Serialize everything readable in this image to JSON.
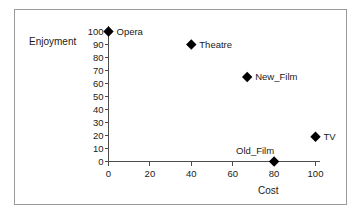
{
  "chart_data": {
    "type": "scatter",
    "title": "",
    "xlabel": "Cost",
    "ylabel": "Enjoyment",
    "xlim": [
      0,
      100
    ],
    "ylim": [
      0,
      100
    ],
    "xticks": [
      0,
      20,
      40,
      60,
      80,
      100
    ],
    "yticks": [
      0,
      10,
      20,
      30,
      40,
      50,
      60,
      70,
      80,
      90,
      100
    ],
    "xtick_labels": [
      "0",
      "20",
      "40",
      "60",
      "80",
      "100"
    ],
    "ytick_labels": [
      "0",
      "10",
      "20",
      "30",
      "40",
      "50",
      "60",
      "70",
      "80",
      "90",
      "100"
    ],
    "grid": false,
    "legend": "none",
    "marker": "diamond",
    "marker_color": "#000000",
    "axis_color": "#4d4d4d",
    "points": [
      {
        "label": "Opera",
        "x": 0,
        "y": 100,
        "label_position": "right"
      },
      {
        "label": "Theatre",
        "x": 40,
        "y": 90,
        "label_position": "right"
      },
      {
        "label": "New_Film",
        "x": 67,
        "y": 65,
        "label_position": "right"
      },
      {
        "label": "TV",
        "x": 100,
        "y": 19,
        "label_position": "right"
      },
      {
        "label": "Old_Film",
        "x": 80,
        "y": 0,
        "label_position": "above-left"
      }
    ]
  },
  "figure": {
    "border_color": "#9a9a9a",
    "background": "#ffffff"
  }
}
